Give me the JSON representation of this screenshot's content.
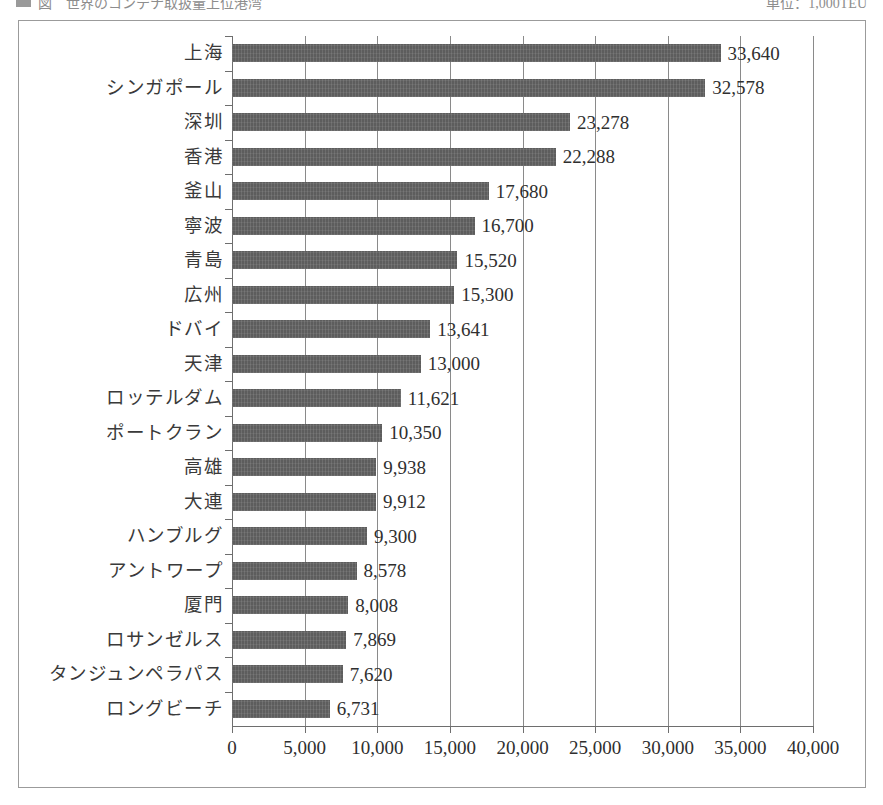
{
  "caption": {
    "marker_icon": "legend-square-icon",
    "left_text": "図　世界のコンテナ取扱量上位港湾",
    "right_text": "単位：1,000TEU"
  },
  "chart_data": {
    "type": "bar",
    "orientation": "horizontal",
    "title": "",
    "xlabel": "",
    "ylabel": "",
    "unit": "1,000TEU",
    "xlim": [
      0,
      40000
    ],
    "xticks": [
      0,
      5000,
      10000,
      15000,
      20000,
      25000,
      30000,
      35000,
      40000
    ],
    "xtick_labels": [
      "0",
      "5,000",
      "10,000",
      "15,000",
      "20,000",
      "25,000",
      "30,000",
      "35,000",
      "40,000"
    ],
    "grid": true,
    "legend": "none",
    "bar_color": "#5d5d5d",
    "categories": [
      "上海",
      "シンガポール",
      "深圳",
      "香港",
      "釜山",
      "寧波",
      "青島",
      "広州",
      "ドバイ",
      "天津",
      "ロッテルダム",
      "ポートクラン",
      "高雄",
      "大連",
      "ハンブルグ",
      "アントワープ",
      "厦門",
      "ロサンゼルス",
      "タンジュンペラパス",
      "ロングビーチ"
    ],
    "values": [
      33640,
      32578,
      23278,
      22288,
      17680,
      16700,
      15520,
      15300,
      13641,
      13000,
      11621,
      10350,
      9938,
      9912,
      9300,
      8578,
      8008,
      7869,
      7620,
      6731
    ],
    "value_labels": [
      "33,640",
      "32,578",
      "23,278",
      "22,288",
      "17,680",
      "16,700",
      "15,520",
      "15,300",
      "13,641",
      "13,000",
      "11,621",
      "10,350",
      "9,938",
      "9,912",
      "9,300",
      "8,578",
      "8,008",
      "7,869",
      "7,620",
      "6,731"
    ]
  }
}
